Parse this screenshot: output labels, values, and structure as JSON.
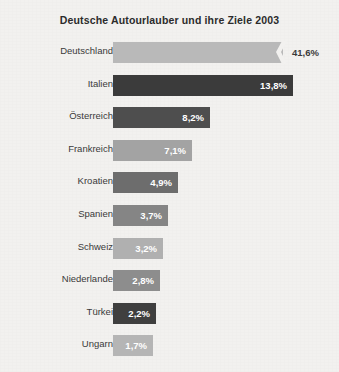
{
  "chart_data": {
    "type": "bar",
    "orientation": "horizontal",
    "title": "Deutsche Autourlauber und ihre Ziele 2003",
    "xlabel": "",
    "ylabel": "",
    "grid": false,
    "legend": false,
    "value_suffix": "%",
    "decimal_separator": ",",
    "axis_note": "Erster Balken (Deutschland) ist mit einem Zickzack-Achsenbruch abgeschnitten dargestellt.",
    "categories": [
      "Deutschland",
      "Italien",
      "Österreich",
      "Frankreich",
      "Kroatien",
      "Spanien",
      "Schweiz",
      "Niederlande",
      "Türkei",
      "Ungarn"
    ],
    "values": [
      41.6,
      13.8,
      8.2,
      7.1,
      4.9,
      3.7,
      3.2,
      2.8,
      2.2,
      1.7
    ],
    "value_labels": [
      "41,6%",
      "13,8%",
      "8,2%",
      "7,1%",
      "4,9%",
      "3,7%",
      "3,2%",
      "2,8%",
      "2,2%",
      "1,7%"
    ],
    "bars": [
      {
        "label": "Deutschland",
        "value": 41.6,
        "value_label": "41,6%",
        "bar_color": "#b9b9b9",
        "value_color": "#3a3a3a",
        "value_position": "outside",
        "truncated": true,
        "pixel_width": 170
      },
      {
        "label": "Italien",
        "value": 13.8,
        "value_label": "13,8%",
        "bar_color": "#3b3b3b",
        "value_color": "#ffffff",
        "value_position": "inside",
        "truncated": false,
        "pixel_width": 180
      },
      {
        "label": "Österreich",
        "value": 8.2,
        "value_label": "8,2%",
        "bar_color": "#4e4e4e",
        "value_color": "#ffffff",
        "value_position": "inside",
        "truncated": false,
        "pixel_width": 97
      },
      {
        "label": "Frankreich",
        "value": 7.1,
        "value_label": "7,1%",
        "bar_color": "#a3a3a3",
        "value_color": "#ffffff",
        "value_position": "inside",
        "truncated": false,
        "pixel_width": 79
      },
      {
        "label": "Kroatien",
        "value": 4.9,
        "value_label": "4,9%",
        "bar_color": "#6d6d6d",
        "value_color": "#ffffff",
        "value_position": "inside",
        "truncated": false,
        "pixel_width": 65
      },
      {
        "label": "Spanien",
        "value": 3.7,
        "value_label": "3,7%",
        "bar_color": "#858585",
        "value_color": "#ffffff",
        "value_position": "inside",
        "truncated": false,
        "pixel_width": 55
      },
      {
        "label": "Schweiz",
        "value": 3.2,
        "value_label": "3,2%",
        "bar_color": "#b0b0b0",
        "value_color": "#ffffff",
        "value_position": "inside",
        "truncated": false,
        "pixel_width": 50
      },
      {
        "label": "Niederlande",
        "value": 2.8,
        "value_label": "2,8%",
        "bar_color": "#8d8d8d",
        "value_color": "#ffffff",
        "value_position": "inside",
        "truncated": false,
        "pixel_width": 47
      },
      {
        "label": "Türkei",
        "value": 2.2,
        "value_label": "2,2%",
        "bar_color": "#3f3f3f",
        "value_color": "#ffffff",
        "value_position": "inside",
        "truncated": false,
        "pixel_width": 43
      },
      {
        "label": "Ungarn",
        "value": 1.7,
        "value_label": "1,7%",
        "bar_color": "#b5b5b5",
        "value_color": "#ffffff",
        "value_position": "inside",
        "truncated": false,
        "pixel_width": 40
      }
    ],
    "background_color": "#f2f1ef",
    "title_color": "#2b2b2b",
    "label_color": "#3a3a3a"
  }
}
